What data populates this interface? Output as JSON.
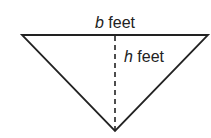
{
  "diagram": {
    "shape": "inverted-triangle",
    "base_label": {
      "var": "b",
      "unit": " feet"
    },
    "height_label": {
      "var": "h",
      "unit": " feet"
    },
    "colors": {
      "stroke": "#222222",
      "background": "#ffffff"
    }
  }
}
